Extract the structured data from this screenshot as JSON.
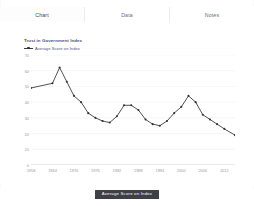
{
  "window": {
    "background": "#ffffff"
  },
  "tabs": [
    {
      "id": "chart",
      "label": "Chart",
      "active": true
    },
    {
      "id": "data",
      "label": "Data",
      "active": false
    },
    {
      "id": "notes",
      "label": "Notes",
      "active": false
    }
  ],
  "chart_header": {
    "title": "Trust in Government Index",
    "legend_label": "Average Score on Index",
    "title_color": "#4a4a7d",
    "series_color": "#333333"
  },
  "legend_button": {
    "label": "Average Score on Index",
    "background": "#3f3f46",
    "text_color": "#ffffff"
  },
  "chart_data": {
    "type": "line",
    "title": "Trust in Government Index",
    "xlabel": "",
    "ylabel": "",
    "xlim": [
      1958,
      2015
    ],
    "ylim": [
      0,
      70
    ],
    "grid": true,
    "legend_position": "top-left",
    "yticks": [
      0,
      10,
      20,
      30,
      40,
      50,
      60,
      70
    ],
    "xticks": [
      1958,
      1964,
      1970,
      1976,
      1982,
      1988,
      1994,
      2000,
      2006,
      2012
    ],
    "series": [
      {
        "name": "Average Score on Index",
        "color": "#333333",
        "marker": "circle",
        "x": [
          1958,
          1964,
          1966,
          1968,
          1970,
          1972,
          1974,
          1976,
          1978,
          1980,
          1982,
          1984,
          1986,
          1988,
          1990,
          1992,
          1994,
          1996,
          1998,
          2000,
          2002,
          2004,
          2006,
          2008,
          2010,
          2012,
          2015
        ],
        "y": [
          49,
          52,
          62,
          53,
          44,
          40,
          33,
          30,
          28,
          27,
          31,
          38,
          38,
          35,
          29,
          26,
          25,
          28,
          33,
          37,
          44,
          40,
          32,
          29,
          26,
          23,
          19
        ]
      }
    ]
  }
}
